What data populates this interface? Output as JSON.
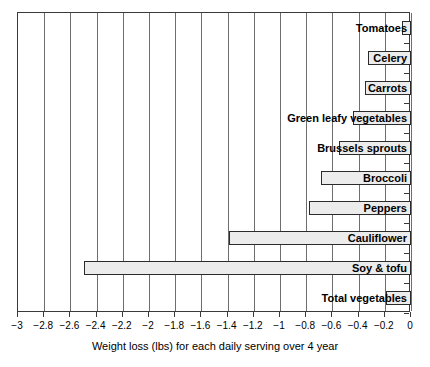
{
  "chart_data": {
    "type": "bar",
    "orientation": "horizontal",
    "title": "",
    "xlabel": "Weight loss (lbs) for each daily serving over 4 year",
    "ylabel": "",
    "xlim": [
      -3,
      0
    ],
    "grid": true,
    "legend": "none",
    "xticks": [
      -3,
      -2.8,
      -2.6,
      -2.4,
      -2.2,
      -2,
      -1.8,
      -1.6,
      -1.4,
      -1.2,
      -1,
      -0.8,
      -0.6,
      -0.4,
      -0.2,
      0
    ],
    "xticklabels": [
      "−3",
      "−2.8",
      "−2.6",
      "−2.4",
      "−2.2",
      "−2",
      "−1.8",
      "−1.6",
      "−1.4",
      "−1.2",
      "−1",
      "−0.8",
      "−0.6",
      "−0.4",
      "−0.2",
      "0"
    ],
    "categories": [
      "Tomatoes",
      "Celery",
      "Carrots",
      "Green leafy vegetables",
      "Brussels sprouts",
      "Broccoli",
      "Peppers",
      "Cauliflower",
      "Soy & tofu",
      "Total vegetables"
    ],
    "values": [
      -0.07,
      -0.33,
      -0.35,
      -0.44,
      -0.55,
      -0.69,
      -0.78,
      -1.39,
      -2.5,
      -0.19
    ],
    "bar_fill_color": "#ececec",
    "bar_edge_color": "#2b2b2b",
    "gridline_color": "#6e6e6e",
    "axis_color": "#3a3a3a",
    "background_color": "#ffffff"
  }
}
